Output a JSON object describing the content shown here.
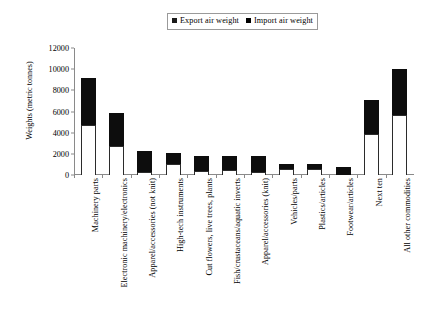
{
  "chart_data": {
    "type": "bar",
    "subtype": "stacked-vertical",
    "title": "",
    "xlabel": "",
    "ylabel": "Weights (metric tonnes)",
    "ylim": [
      0,
      12000
    ],
    "yticks": [
      0,
      2000,
      4000,
      6000,
      8000,
      10000,
      12000
    ],
    "ytick_labels": [
      "0",
      "2000",
      "4000",
      "6000",
      "8000",
      "10000",
      "12000"
    ],
    "grid": false,
    "legend_position": "top-center",
    "categories": [
      "Machinery parts",
      "Electronic machinery/electronics",
      "Apparel/accessories (not knit)",
      "High-tech instruments",
      "Cut flowers, live trees, plants",
      "Fish/crustaceans/aquatic inverts",
      "Apparel/accessories (knit)",
      "Vehicles/parts",
      "Plastics/articles",
      "Footwear/articles",
      "Next ten",
      "All other commodities"
    ],
    "series": [
      {
        "name": "Export air weight",
        "color": "#ffffff",
        "edge_color": "#2b2b2b",
        "values": [
          4750,
          2750,
          300,
          1050,
          350,
          450,
          250,
          550,
          550,
          0,
          3900,
          5700
        ]
      },
      {
        "name": "Import air weight",
        "color": "#0d0d0d",
        "edge_color": "#0d0d0d",
        "values": [
          4400,
          3150,
          2000,
          1000,
          1450,
          1350,
          1550,
          500,
          500,
          800,
          3200,
          4300
        ]
      }
    ],
    "totals": [
      9150,
      5900,
      2300,
      2050,
      1800,
      1800,
      1800,
      1050,
      1050,
      800,
      7100,
      10000
    ]
  },
  "legend": {
    "entries": [
      {
        "label": "Export air weight",
        "swatch": "export-swatch"
      },
      {
        "label": "Import air weight",
        "swatch": "import-swatch"
      }
    ]
  },
  "axes": {
    "y_title": "Weights (metric tonnes)"
  }
}
